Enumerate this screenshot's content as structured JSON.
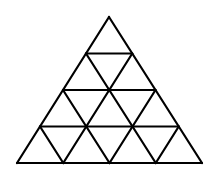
{
  "diagram": {
    "type": "subdivided-triangle",
    "rows": 4,
    "small_triangles": 16,
    "stroke_color": "#000000",
    "background_color": "#ffffff",
    "stroke_width": 2.2,
    "apex": [
      109,
      17
    ],
    "base_left": [
      17,
      163
    ],
    "base_right": [
      202,
      163
    ]
  }
}
